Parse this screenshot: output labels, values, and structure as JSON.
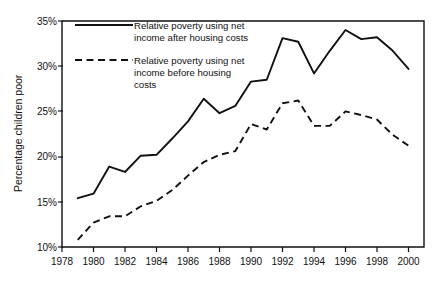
{
  "chart_data": {
    "type": "line",
    "title": "",
    "subtitle": "",
    "xlabel": "",
    "ylabel": "Percentage children poor",
    "xlim": [
      1978,
      2000.9
    ],
    "ylim": [
      10,
      35
    ],
    "grid": false,
    "legend_position": "top-left inside plot area",
    "y_ticks": [
      "10%",
      "15%",
      "20%",
      "25%",
      "30%",
      "35%"
    ],
    "y_tick_values": [
      10,
      15,
      20,
      25,
      30,
      35
    ],
    "x_ticks": [
      "1978",
      "1980",
      "1982",
      "1984",
      "1986",
      "1988",
      "1990",
      "1992",
      "1994",
      "1996",
      "1998",
      "2000"
    ],
    "x_tick_values": [
      1978,
      1980,
      1982,
      1984,
      1986,
      1988,
      1990,
      1992,
      1994,
      1996,
      1998,
      2000
    ],
    "x": [
      1979,
      1980,
      1981,
      1982,
      1983,
      1984,
      1985,
      1986,
      1987,
      1988,
      1989,
      1990,
      1991,
      1992,
      1993,
      1994,
      1995,
      1996,
      1997,
      1998,
      1999,
      2000
    ],
    "series": [
      {
        "name": "Relative poverty using net income after housing costs",
        "style": "solid",
        "values": [
          15.4,
          15.9,
          18.9,
          18.3,
          20.1,
          20.2,
          22.0,
          23.9,
          26.4,
          24.8,
          25.6,
          28.3,
          28.5,
          33.1,
          32.7,
          29.2,
          31.7,
          34.0,
          33.0,
          33.2,
          31.7,
          29.7
        ]
      },
      {
        "name": "Relative poverty using net income before housing costs",
        "style": "dashed",
        "values": [
          10.8,
          12.7,
          13.4,
          13.4,
          14.5,
          15.1,
          16.3,
          17.9,
          19.4,
          20.2,
          20.6,
          23.6,
          23.0,
          25.9,
          26.2,
          23.4,
          23.4,
          25.0,
          24.6,
          24.1,
          22.4,
          21.2
        ]
      }
    ],
    "legend": [
      {
        "style": "solid",
        "lines": [
          "Relative poverty using net",
          "income after housing costs"
        ]
      },
      {
        "style": "dashed",
        "lines": [
          "Relative poverty using net",
          "income before housing",
          "costs"
        ]
      }
    ]
  }
}
